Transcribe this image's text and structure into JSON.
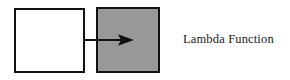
{
  "diagram": {
    "background_color": "#ffffff",
    "nodes": [
      {
        "id": "input-box",
        "label": "",
        "fill_color": "#ffffff",
        "border_color": "#111111",
        "shape": "rectangle"
      },
      {
        "id": "lambda-box",
        "label": "",
        "fill_color": "#999999",
        "border_color": "#111111",
        "shape": "rectangle"
      }
    ],
    "connectors": [
      {
        "id": "input-to-lambda",
        "type": "arrow",
        "direction": "right",
        "color": "#111111",
        "from": "input-box",
        "to": "lambda-box"
      }
    ],
    "legend": {
      "lambda_label": "Lambda Function",
      "text_color": "#1a1a1a"
    }
  }
}
